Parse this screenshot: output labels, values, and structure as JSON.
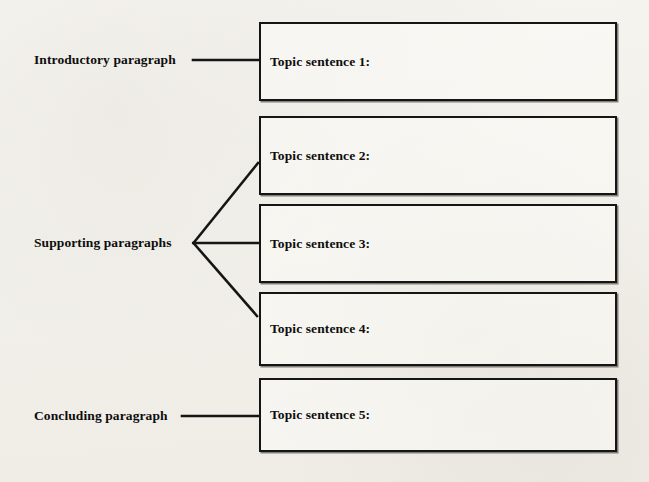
{
  "diagram": {
    "background_color": "#f3f1ec",
    "line_color": "#151515",
    "text_color": "#0d0d0d",
    "stage_labels": [
      {
        "id": "intro",
        "text": "Introductory paragraph"
      },
      {
        "id": "supporting",
        "text": "Supporting paragraphs"
      },
      {
        "id": "concluding",
        "text": "Concluding paragraph"
      }
    ],
    "boxes": [
      {
        "id": "box-1",
        "text": "Topic sentence 1:"
      },
      {
        "id": "box-2",
        "text": "Topic sentence 2:"
      },
      {
        "id": "box-3",
        "text": "Topic sentence 3:"
      },
      {
        "id": "box-4",
        "text": "Topic sentence 4:"
      },
      {
        "id": "box-5",
        "text": "Topic sentence 5:"
      }
    ],
    "connectors": [
      {
        "id": "connector-intro",
        "from": "intro",
        "to": "box-1",
        "style": "straight"
      },
      {
        "id": "connector-supporting-upper",
        "from": "supporting",
        "to": "box-2",
        "style": "diagonal"
      },
      {
        "id": "connector-supporting-middle",
        "from": "supporting",
        "to": "box-3",
        "style": "straight"
      },
      {
        "id": "connector-supporting-lower",
        "from": "supporting",
        "to": "box-4",
        "style": "diagonal"
      },
      {
        "id": "connector-concluding",
        "from": "concluding",
        "to": "box-5",
        "style": "straight"
      }
    ]
  }
}
